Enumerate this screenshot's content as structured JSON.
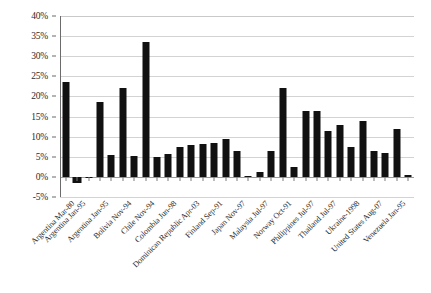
{
  "chart_data": {
    "type": "bar",
    "title": "",
    "subtitle": "",
    "xlabel": "",
    "ylabel": "",
    "ylim": [
      -5,
      40
    ],
    "ytick_step": 5,
    "ytick_labels": [
      "40%",
      "35%",
      "30%",
      "25%",
      "20%",
      "15%",
      "10%",
      "5%",
      "0%",
      "-5%"
    ],
    "ytick_values": [
      40,
      35,
      30,
      25,
      20,
      15,
      10,
      5,
      0,
      -5
    ],
    "grid": true,
    "legend": false,
    "legend_position": "none",
    "bar_color": "#111111",
    "categories": [
      "Argentina Mar-80",
      "Argentina Jan-95",
      "Bolivia Nov-94",
      "Chile Nov-94",
      "Colombia Jun-98",
      "Dominican Republic Apr-03",
      "Finland Sep-91",
      "Japan Nov-97",
      "Malaysia Jul-97",
      "Norway Oct-91",
      "Philippines Jul-97",
      "Thailand Jul-97",
      "Ukraine-1998",
      "United States Aug-07",
      "Venezuela Jan-95"
    ],
    "values": [
      23.5,
      -1.5,
      18.5,
      33.5,
      5.5,
      22.2,
      5.2,
      5.0,
      5.7,
      22.0,
      16.5,
      16.5,
      14.0,
      5.0,
      12.0
    ],
    "series": [
      {
        "name": "",
        "values": [
          23.5,
          -1.5,
          18.5,
          33.5,
          5.5,
          22.2,
          5.2,
          5.0,
          5.7,
          22.0,
          16.5,
          16.5,
          14.0,
          5.0,
          12.0
        ]
      }
    ],
    "bars": [
      {
        "label": "Argentina Mar-80",
        "value": 23.5
      },
      {
        "label": "Argentina Jan-95",
        "value": -1.5
      },
      {
        "label": "",
        "value": 0
      },
      {
        "label": "Argentina Jan-95",
        "value": 18.5
      },
      {
        "label": "",
        "value": 5.5
      },
      {
        "label": "Bolivia Nov-94",
        "value": 22.2
      },
      {
        "label": "",
        "value": 5.2
      },
      {
        "label": "Chile Nov-94",
        "value": 33.5
      },
      {
        "label": "",
        "value": 5.0
      },
      {
        "label": "Colombia Jun-98",
        "value": 5.7
      },
      {
        "label": "",
        "value": 7.5
      },
      {
        "label": "Dominican Republic Apr-03",
        "value": 8.0
      },
      {
        "label": "",
        "value": 8.3
      },
      {
        "label": "Finland Sep-91",
        "value": 8.5
      },
      {
        "label": "",
        "value": 9.5
      },
      {
        "label": "Japan Nov-97",
        "value": 6.5
      },
      {
        "label": "",
        "value": 0.3
      },
      {
        "label": "Malaysia Jul-97",
        "value": 1.3
      },
      {
        "label": "",
        "value": 6.5
      },
      {
        "label": "Norway Oct-91",
        "value": 22.0
      },
      {
        "label": "",
        "value": 2.5
      },
      {
        "label": "Philippines Jul-97",
        "value": 16.5
      },
      {
        "label": "",
        "value": 16.5
      },
      {
        "label": "Thailand Jul-97",
        "value": 11.5
      },
      {
        "label": "",
        "value": 12.8
      },
      {
        "label": "Ukraine-1998",
        "value": 7.5
      },
      {
        "label": "",
        "value": 14.0
      },
      {
        "label": "United States Aug-07",
        "value": 6.5
      },
      {
        "label": "",
        "value": 6.0
      },
      {
        "label": "Venezuela Jan-95",
        "value": 12.0
      },
      {
        "label": "",
        "value": 0.5
      }
    ]
  }
}
